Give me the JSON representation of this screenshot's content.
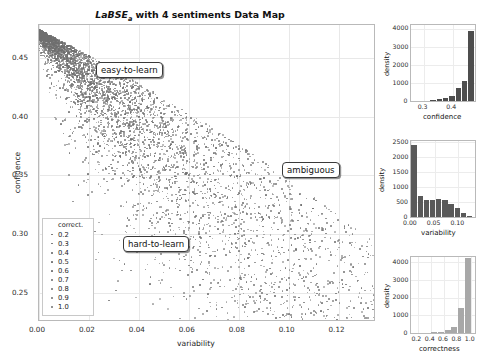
{
  "figure": {
    "title_main": "LaBSE",
    "title_sub": "a",
    "title_rest": " with 4 sentiments Data Map"
  },
  "main_plot": {
    "xlabel": "variability",
    "ylabel": "confidence",
    "xticks": [
      "0.00",
      "0.02",
      "0.04",
      "0.06",
      "0.08",
      "0.10",
      "0.12"
    ],
    "yticks": [
      "0.45",
      "0.40",
      "0.35",
      "0.30",
      "0.25"
    ],
    "annotations": [
      {
        "name": "easy-to-learn",
        "label": "easy-to-learn"
      },
      {
        "name": "ambiguous",
        "label": "ambiguous"
      },
      {
        "name": "hard-to-learn",
        "label": "hard-to-learn"
      }
    ],
    "legend": {
      "title": "correct.",
      "entries": [
        "0.2",
        "0.3",
        "0.4",
        "0.5",
        "0.6",
        "0.7",
        "0.8",
        "0.9",
        "1.0"
      ]
    }
  },
  "chart_data": [
    {
      "type": "scatter",
      "name": "data-map-scatter",
      "title": "LaBSE_a with 4 sentiments Data Map",
      "xlabel": "variability",
      "ylabel": "confidence",
      "xlim": [
        0.0,
        0.135
      ],
      "ylim": [
        0.225,
        0.478
      ],
      "grid": true,
      "point_color": "#6f6f6f",
      "legend_title": "correct.",
      "legend_values": [
        0.2,
        0.3,
        0.4,
        0.5,
        0.6,
        0.7,
        0.8,
        0.9,
        1.0
      ],
      "annotations": [
        "easy-to-learn",
        "ambiguous",
        "hard-to-learn"
      ],
      "n_points_approx": 5700,
      "description": "Dense wedge-shaped cloud: high-confidence low-variability points at upper-left tapering down-right to a diffuse low-confidence high-variability tail."
    },
    {
      "type": "bar",
      "name": "confidence-histogram",
      "xlabel": "confidence",
      "ylabel": "density",
      "xticks": [
        "0.3",
        "0.4"
      ],
      "yticks": [
        "0",
        "1000",
        "2000",
        "3000",
        "4000"
      ],
      "ylim": [
        0,
        4200
      ],
      "xlim": [
        0.255,
        0.478
      ],
      "bar_color": "#4d4d4d",
      "bin_centers": [
        0.266,
        0.288,
        0.31,
        0.332,
        0.354,
        0.376,
        0.398,
        0.42,
        0.442,
        0.464
      ],
      "values": [
        8,
        14,
        28,
        55,
        110,
        185,
        300,
        700,
        1090,
        3880
      ]
    },
    {
      "type": "bar",
      "name": "variability-histogram",
      "xlabel": "variability",
      "ylabel": "density",
      "xticks": [
        "0.00",
        "0.05",
        "0.10"
      ],
      "yticks": [
        "0",
        "500",
        "1000",
        "1500",
        "2000",
        "2500"
      ],
      "ylim": [
        0,
        2550
      ],
      "xlim": [
        0.0,
        0.135
      ],
      "bar_color": "#595959",
      "bin_centers": [
        0.0065,
        0.0195,
        0.0325,
        0.0455,
        0.0585,
        0.0715,
        0.0845,
        0.0975,
        0.1105,
        0.1235
      ],
      "values": [
        2420,
        690,
        560,
        560,
        600,
        580,
        450,
        290,
        130,
        35
      ]
    },
    {
      "type": "bar",
      "name": "correctness-histogram",
      "xlabel": "correctness",
      "ylabel": "density",
      "xticks": [
        "0.2",
        "0.4",
        "0.6",
        "0.8",
        "1.0"
      ],
      "yticks": [
        "0",
        "1000",
        "2000",
        "3000",
        "4000"
      ],
      "ylim": [
        0,
        4300
      ],
      "xlim": [
        0.1,
        1.06
      ],
      "bar_color": "#a8a8a8",
      "bin_centers": [
        0.15,
        0.25,
        0.35,
        0.45,
        0.55,
        0.65,
        0.75,
        0.85,
        0.95
      ],
      "values": [
        5,
        10,
        18,
        30,
        60,
        150,
        330,
        1400,
        4250
      ]
    }
  ],
  "histograms": {
    "confidence": {
      "xlabel": "confidence",
      "ylabel": "density"
    },
    "variability": {
      "xlabel": "variability",
      "ylabel": "density"
    },
    "correctness": {
      "xlabel": "correctness",
      "ylabel": "density"
    }
  }
}
